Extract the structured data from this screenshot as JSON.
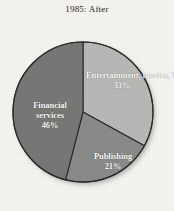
{
  "chart_data": {
    "type": "pie",
    "title": "1985: After",
    "categories": [
      "Entertainment, movies, TV",
      "Publishing",
      "Financial services"
    ],
    "values": [
      33,
      21,
      46
    ],
    "unit": "%",
    "start_angle_deg": 0,
    "direction": "clockwise",
    "legend": "none",
    "grid": false,
    "slices": [
      {
        "name": "Entertainment, movies, TV",
        "label_line1": "Entertainment,",
        "label_line2": "movies, TV",
        "value": 33,
        "value_label": "33%",
        "color": "#b9b9b7",
        "start_deg": 0,
        "end_deg": 118.8
      },
      {
        "name": "Publishing",
        "label_line1": "Publishing",
        "label_line2": "",
        "value": 21,
        "value_label": "21%",
        "color": "#8b8b89",
        "start_deg": 118.8,
        "end_deg": 194.4
      },
      {
        "name": "Financial services",
        "label_line1": "Financial",
        "label_line2": "services",
        "value": 46,
        "value_label": "46%",
        "color": "#787876",
        "start_deg": 194.4,
        "end_deg": 360
      }
    ],
    "stroke_color": "#2b2b2b",
    "background_color": "#f6f5f2"
  }
}
